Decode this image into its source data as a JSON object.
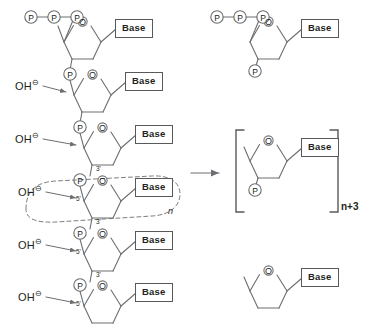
{
  "diagram": {
    "type": "chemical-reaction-scheme",
    "atom_labels": {
      "ring_oxygen": "O",
      "phosphate": "P",
      "hydroxide": "OH",
      "negative_charge": "⊖"
    },
    "base_label": "Base",
    "prime_labels": {
      "three_prime": "3'",
      "five_prime": "5'"
    },
    "repeat_unit_label": "n",
    "product_subscript_prefix": "n",
    "product_subscript": "n+3",
    "colors": {
      "bond": "#6d6e71",
      "text": "#231f20",
      "box_border": "#58595b",
      "dashed_outline": "#6d6e71",
      "background": "#ffffff"
    }
  },
  "left_chain": {
    "description": "Polynucleotide strand drawn vertically, 5' triphosphate at top",
    "terminal_triphosphate": [
      "P",
      "P",
      "P"
    ],
    "units": [
      {
        "index": 1,
        "base": "Base",
        "five_prime_group": "triphosphate",
        "three_prime_group": "P",
        "hydroxide_attack": false,
        "prime_marks": []
      },
      {
        "index": 2,
        "base": "Base",
        "five_prime_group": "P",
        "three_prime_group": "P",
        "hydroxide_attack": true,
        "prime_marks": []
      },
      {
        "index": 3,
        "base": "Base",
        "five_prime_group": "P",
        "three_prime_group": "P",
        "hydroxide_attack": true,
        "prime_marks": [
          "3'"
        ]
      },
      {
        "index": 4,
        "base": "Base",
        "five_prime_group": "P",
        "three_prime_group": "P",
        "hydroxide_attack": true,
        "prime_marks": [
          "5'",
          "3'"
        ],
        "circled_repeat_unit": true
      },
      {
        "index": 5,
        "base": "Base",
        "five_prime_group": "P",
        "three_prime_group": "P",
        "hydroxide_attack": true,
        "prime_marks": [
          "5'",
          "3'"
        ]
      },
      {
        "index": 6,
        "base": "Base",
        "five_prime_group": "P",
        "three_prime_group": "none",
        "hydroxide_attack": true,
        "prime_marks": [
          "5'"
        ]
      }
    ],
    "hydroxide_labels": [
      "OH",
      "OH",
      "OH",
      "OH",
      "OH"
    ]
  },
  "reaction_arrow": {
    "direction": "right",
    "label": ""
  },
  "right_products": [
    {
      "id": "top-product",
      "base": "Base",
      "five_prime_group": "triphosphate",
      "five_prime_phosphates": [
        "P",
        "P",
        "P"
      ],
      "three_prime_group": "P",
      "bracketed": false
    },
    {
      "id": "bracketed-product",
      "base": "Base",
      "five_prime_group": "open-bond",
      "three_prime_group": "P",
      "bracketed": true,
      "subscript": "n+3"
    },
    {
      "id": "bottom-product",
      "base": "Base",
      "five_prime_group": "open-bond",
      "three_prime_group": "none",
      "bracketed": false
    }
  ]
}
